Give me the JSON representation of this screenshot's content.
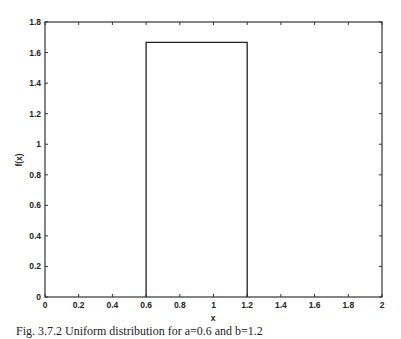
{
  "chart_data": {
    "type": "line",
    "title": "",
    "xlabel": "x",
    "ylabel": "f(x)",
    "xlim": [
      0,
      2
    ],
    "ylim": [
      0,
      1.8
    ],
    "grid": false,
    "legend": null,
    "x_ticks": [
      "0",
      "0.2",
      "0.4",
      "0.6",
      "0.8",
      "1",
      "1.2",
      "1.4",
      "1.6",
      "1.8",
      "2"
    ],
    "y_ticks": [
      "0",
      "0.2",
      "0.4",
      "0.6",
      "0.8",
      "1",
      "1.2",
      "1.4",
      "1.6",
      "1.8"
    ],
    "series": [
      {
        "name": "uniform pdf",
        "x": [
          0.6,
          0.6,
          1.2,
          1.2
        ],
        "y": [
          0,
          1.6667,
          1.6667,
          0
        ]
      }
    ],
    "distribution": {
      "a": 0.6,
      "b": 1.2,
      "height": 1.6667
    }
  },
  "caption": "Fig. 3.7.2 Uniform distribution for a=0.6 and b=1.2"
}
